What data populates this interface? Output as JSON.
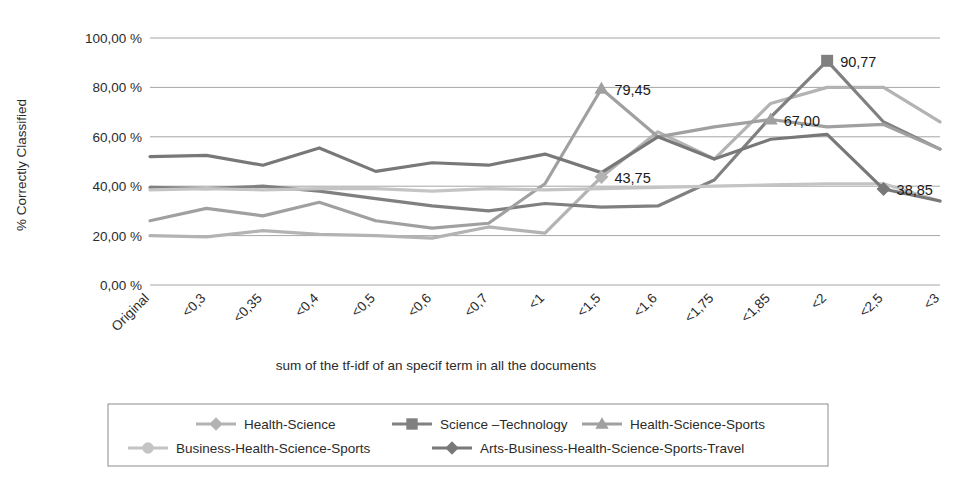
{
  "chart_data": {
    "type": "line",
    "title": "",
    "xlabel": "sum of the tf-idf of an specif term in all the documents",
    "ylabel": "% Correctly Classified",
    "ylim": [
      0,
      100
    ],
    "ytick_labels": [
      "0,00 %",
      "20,00 %",
      "40,00 %",
      "60,00 %",
      "80,00 %",
      "100,00 %"
    ],
    "ytick_values": [
      0,
      20,
      40,
      60,
      80,
      100
    ],
    "grid": true,
    "legend_position": "bottom",
    "categories": [
      "Original",
      "<0,3",
      "<0,35",
      "<0,4",
      "<0,5",
      "<0,6",
      "<0,7",
      "<1",
      "<1,5",
      "<1,6",
      "<1,75",
      "<1,85",
      "<2",
      "<2,5",
      "<3"
    ],
    "series": [
      {
        "name": "Health-Science",
        "marker": "diamond",
        "color": "#b3b3b3",
        "values": [
          20.0,
          19.5,
          22.0,
          20.5,
          20.0,
          19.0,
          23.5,
          21.0,
          43.75,
          62.0,
          51.0,
          73.5,
          80.0,
          80.0,
          66.0
        ]
      },
      {
        "name": "Science –Technology",
        "marker": "square",
        "color": "#808080",
        "values": [
          39.5,
          39.0,
          40.0,
          38.0,
          35.0,
          32.0,
          30.0,
          33.0,
          31.5,
          32.0,
          42.5,
          68.0,
          90.77,
          66.0,
          55.0
        ]
      },
      {
        "name": "Health-Science-Sports",
        "marker": "triangle",
        "color": "#a0a0a0",
        "values": [
          26.0,
          31.0,
          28.0,
          33.5,
          26.0,
          23.0,
          25.0,
          41.0,
          79.45,
          60.0,
          64.0,
          67.0,
          64.0,
          65.0,
          55.0
        ]
      },
      {
        "name": "Business-Health-Science-Sports",
        "marker": "circle",
        "color": "#c4c4c4",
        "values": [
          38.5,
          39.0,
          38.5,
          39.0,
          39.0,
          38.0,
          39.0,
          38.5,
          39.0,
          39.5,
          40.0,
          40.5,
          41.0,
          41.0,
          34.0
        ]
      },
      {
        "name": "Arts-Business-Health-Science-Sports-Travel",
        "marker": "diamond",
        "color": "#787878",
        "values": [
          52.0,
          52.5,
          48.5,
          55.5,
          46.0,
          49.5,
          48.5,
          53.0,
          45.5,
          60.0,
          51.0,
          59.0,
          61.0,
          38.85,
          34.0
        ]
      }
    ],
    "data_labels": [
      {
        "text": "79,45",
        "series": "Health-Science-Sports",
        "category": "<1,5",
        "value": 79.45
      },
      {
        "text": "43,75",
        "series": "Health-Science",
        "category": "<1,5",
        "value": 43.75
      },
      {
        "text": "67,00",
        "series": "Health-Science-Sports",
        "category": "<1,85",
        "value": 67.0
      },
      {
        "text": "90,77",
        "series": "Science –Technology",
        "category": "<2",
        "value": 90.77
      },
      {
        "text": "38,85",
        "series": "Arts-Business-Health-Science-Sports-Travel",
        "category": "<2,5",
        "value": 38.85
      }
    ]
  },
  "legend": {
    "items": [
      {
        "label": "Health-Science",
        "marker": "diamond",
        "color": "#b3b3b3"
      },
      {
        "label": "Science –Technology",
        "marker": "square",
        "color": "#808080"
      },
      {
        "label": "Health-Science-Sports",
        "marker": "triangle",
        "color": "#a0a0a0"
      },
      {
        "label": "Business-Health-Science-Sports",
        "marker": "circle",
        "color": "#c4c4c4"
      },
      {
        "label": "Arts-Business-Health-Science-Sports-Travel",
        "marker": "diamond",
        "color": "#787878"
      }
    ]
  }
}
